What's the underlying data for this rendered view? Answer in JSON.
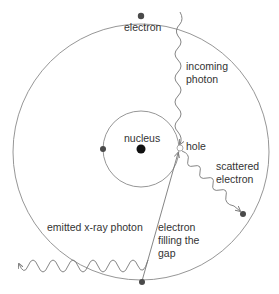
{
  "diagram": {
    "type": "atomic-x-ray-emission",
    "colors": {
      "line": "#8a8a8a",
      "electron": "#4a4a4a",
      "nucleus": "#111111",
      "text": "#333333",
      "background": "#ffffff"
    },
    "labels": {
      "electron_top": "electron",
      "incoming_photon_line1": "incoming",
      "incoming_photon_line2": "photon",
      "nucleus": "nucleus",
      "hole": "hole",
      "scattered_line1": "scattered",
      "scattered_line2": "electron",
      "emitted": "emitted x-ray photon",
      "filling_line1": "electron",
      "filling_line2": "filling the",
      "filling_line3": "gap"
    },
    "nodes": [
      {
        "id": "nucleus",
        "x": 141,
        "y": 149
      },
      {
        "id": "electron-top",
        "x": 141,
        "y": 16
      },
      {
        "id": "electron-inner-left",
        "x": 103,
        "y": 149
      },
      {
        "id": "hole",
        "x": 180,
        "y": 148
      },
      {
        "id": "scattered-electron",
        "x": 243,
        "y": 214
      },
      {
        "id": "electron-bottom",
        "x": 142,
        "y": 282
      }
    ]
  }
}
